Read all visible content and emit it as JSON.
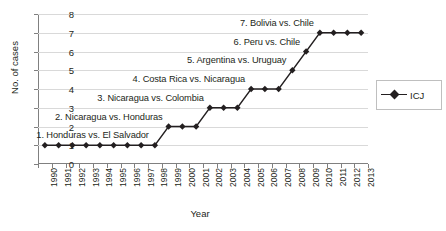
{
  "chart_data": {
    "type": "line",
    "title": "",
    "xlabel": "Year",
    "ylabel": "No. of cases",
    "ylim": [
      0,
      8
    ],
    "ytick_step": 1,
    "yticks": [
      0,
      1,
      2,
      3,
      4,
      5,
      6,
      7,
      8
    ],
    "grid": "horizontal",
    "legend_position": "right",
    "categories": [
      "1990",
      "1991",
      "1992",
      "1993",
      "1994",
      "1995",
      "1996",
      "1997",
      "1998",
      "1999",
      "2000",
      "2001",
      "2002",
      "2003",
      "2004",
      "2005",
      "2006",
      "2007",
      "2008",
      "2009",
      "2010",
      "2011",
      "2012",
      "2013"
    ],
    "series": [
      {
        "name": "ICJ",
        "marker": "diamond",
        "color": "#231f20",
        "values": [
          1,
          1,
          1,
          1,
          1,
          1,
          1,
          1,
          1,
          2,
          2,
          2,
          3,
          3,
          3,
          4,
          4,
          4,
          5,
          6,
          7,
          7,
          7,
          7
        ]
      }
    ],
    "annotations": [
      {
        "text": "1. Honduras vs. El Salvador",
        "year": "1998",
        "value": 1
      },
      {
        "text": "2. Nicaragua vs. Honduras",
        "year": "1999",
        "value": 2
      },
      {
        "text": "3. Nicaragua vs. Colombia",
        "year": "2002",
        "value": 3
      },
      {
        "text": "4. Costa Rica vs. Nicaragua",
        "year": "2005",
        "value": 4
      },
      {
        "text": "5. Argentina vs. Uruguay",
        "year": "2008",
        "value": 5
      },
      {
        "text": "6. Peru vs. Chile",
        "year": "2009",
        "value": 6
      },
      {
        "text": "7. Bolivia vs. Chile",
        "year": "2010",
        "value": 7
      }
    ]
  },
  "legend": {
    "entries": [
      {
        "label": "ICJ"
      }
    ]
  }
}
